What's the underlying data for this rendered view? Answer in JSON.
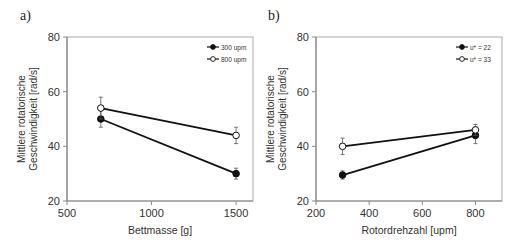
{
  "panels": [
    {
      "label": "a)"
    },
    {
      "label": "b)"
    }
  ],
  "chart_data": [
    {
      "type": "line",
      "panel": "a)",
      "title": "",
      "xlabel": "Bettmasse [g]",
      "ylabel": "Mittlere rotatorische Geschwindigkeit [rad/s]",
      "ylabel_lines": [
        "Mittlere rotatorische",
        "Geschwindigkeit  [rad/s]"
      ],
      "xlim": [
        500,
        1600
      ],
      "ylim": [
        20,
        80
      ],
      "xticks": [
        500,
        1000,
        1500
      ],
      "yticks": [
        20,
        40,
        60,
        80
      ],
      "grid": false,
      "legend_position": "upper right",
      "series": [
        {
          "name": "300 upm",
          "marker": "filled-circle",
          "x": [
            700,
            1500
          ],
          "y": [
            50,
            30
          ],
          "err": [
            3,
            2
          ]
        },
        {
          "name": "800 upm",
          "marker": "open-circle",
          "x": [
            700,
            1500
          ],
          "y": [
            54,
            44
          ],
          "err": [
            4,
            3
          ]
        }
      ]
    },
    {
      "type": "line",
      "panel": "b)",
      "title": "",
      "xlabel": "Rotordrehzahl  [upm]",
      "ylabel": "Mittlere rotatorische Geschwindigkeit [rad/s]",
      "ylabel_lines": [
        "Mittlere rotatorische",
        "Geschwindigkeit  [rad/s]"
      ],
      "xlim": [
        200,
        900
      ],
      "ylim": [
        20,
        80
      ],
      "xticks": [
        200,
        400,
        600,
        800
      ],
      "yticks": [
        20,
        40,
        60,
        80
      ],
      "grid": false,
      "legend_position": "upper right",
      "series": [
        {
          "name": "u* = 22",
          "marker": "filled-circle",
          "x": [
            300,
            800
          ],
          "y": [
            29.5,
            44
          ],
          "err": [
            1.5,
            3
          ]
        },
        {
          "name": "u* = 33",
          "marker": "open-circle",
          "x": [
            300,
            800
          ],
          "y": [
            40,
            46
          ],
          "err": [
            3,
            2
          ]
        }
      ]
    }
  ]
}
